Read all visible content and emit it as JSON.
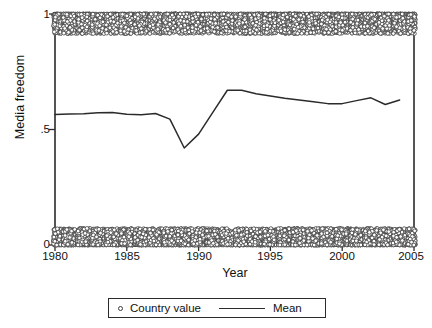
{
  "chart_data": {
    "type": "scatter",
    "title": "",
    "xlabel": "Year",
    "ylabel": "Media freedom",
    "xlim": [
      1980,
      2005
    ],
    "ylim": [
      0,
      1
    ],
    "grid": false,
    "xticks": [
      "1980",
      "1985",
      "1990",
      "1995",
      "2000",
      "2005"
    ],
    "xtick_values": [
      1980,
      1985,
      1990,
      1995,
      2000,
      2005
    ],
    "yticks": [
      "0",
      ".5",
      "1"
    ],
    "ytick_values": [
      0,
      0.5,
      1
    ],
    "legend": {
      "position": "below-axes",
      "entries": [
        {
          "label": "Country value",
          "marker": "open-circle"
        },
        {
          "label": "Mean",
          "marker": "line"
        }
      ]
    },
    "series": [
      {
        "name": "Mean",
        "type": "line",
        "color": "#2b2b2b",
        "x": [
          1980,
          1981,
          1982,
          1983,
          1984,
          1985,
          1986,
          1987,
          1988,
          1989,
          1990,
          1991,
          1992,
          1993,
          1994,
          1995,
          1996,
          1997,
          1998,
          1999,
          2000,
          2001,
          2002,
          2003,
          2004
        ],
        "values": [
          0.565,
          0.567,
          0.568,
          0.573,
          0.574,
          0.566,
          0.564,
          0.569,
          0.545,
          0.42,
          0.48,
          0.575,
          0.67,
          0.67,
          0.655,
          0.645,
          0.635,
          0.628,
          0.62,
          0.612,
          0.612,
          0.625,
          0.637,
          0.608,
          0.628
        ]
      },
      {
        "name": "Country value",
        "type": "scatter",
        "marker": "open-circle",
        "color": "#3a3a3a",
        "description": "Dense point cloud: a top band clustered between about 0.92 and 1.00, and a bottom band clustered between about 0.00 and 0.07, spanning all years 1980-2005",
        "bands": [
          {
            "name": "top-band",
            "y_min": 0.915,
            "y_max": 1.0,
            "density": "very high"
          },
          {
            "name": "bottom-band",
            "y_min": 0.0,
            "y_max": 0.072,
            "density": "very high"
          }
        ]
      }
    ]
  }
}
